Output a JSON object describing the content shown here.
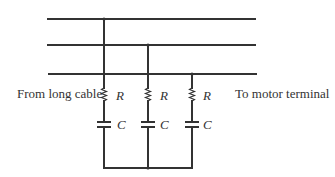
{
  "labels": {
    "left": "From long cable",
    "right": "To motor terminal"
  },
  "components": {
    "resistor_symbol": "R",
    "capacitor_symbol": "C"
  },
  "branches": [
    {
      "resistor": "R",
      "capacitor": "C"
    },
    {
      "resistor": "R",
      "capacitor": "C"
    },
    {
      "resistor": "R",
      "capacitor": "C"
    }
  ],
  "colors": {
    "line": "#333333",
    "background": "#ffffff"
  }
}
